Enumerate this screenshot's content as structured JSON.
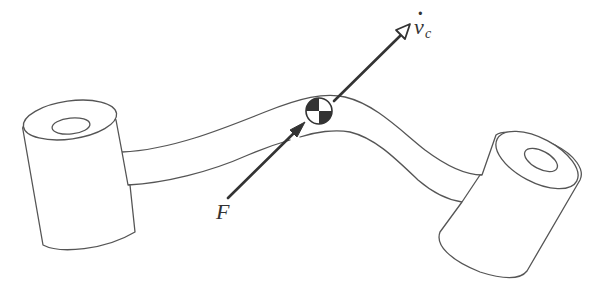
{
  "figure": {
    "type": "diagram",
    "labels": {
      "force": "F",
      "velocity_symbol": "v",
      "velocity_dot": "·",
      "velocity_subscript": "c"
    },
    "elements": [
      {
        "name": "left-cylinder-boss",
        "description": "cylindrical boss with bore on left end"
      },
      {
        "name": "right-cylinder-boss",
        "description": "cylindrical boss with bore on right end"
      },
      {
        "name": "curved-beam",
        "description": "S-curved beam connecting bosses"
      },
      {
        "name": "center-of-mass-symbol",
        "description": "quartered circle marking center of mass"
      },
      {
        "name": "force-arrow",
        "description": "force F applied toward center of mass"
      },
      {
        "name": "acceleration-arrow",
        "description": "acceleration of center of mass, v-dot sub c"
      }
    ],
    "colors": {
      "line": "#555555",
      "arrow": "#333333",
      "background": "#ffffff"
    }
  }
}
